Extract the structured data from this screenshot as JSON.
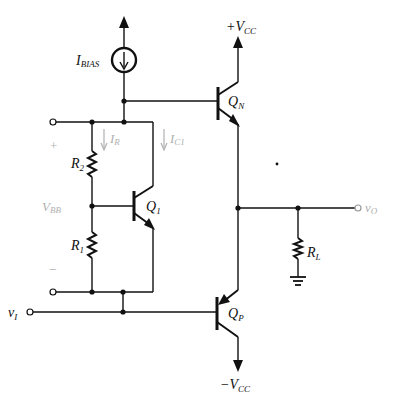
{
  "diagram": {
    "type": "circuit-schematic",
    "labels": {
      "vcc_pos": {
        "main": "+V",
        "sub": "CC"
      },
      "vcc_neg": {
        "main": "−V",
        "sub": "CC"
      },
      "ibias": {
        "main": "I",
        "sub": "BIAS"
      },
      "qn": {
        "main": "Q",
        "sub": "N"
      },
      "qp": {
        "main": "Q",
        "sub": "P"
      },
      "q1": {
        "main": "Q",
        "sub": "1"
      },
      "r1": {
        "main": "R",
        "sub": "1"
      },
      "r2": {
        "main": "R",
        "sub": "2"
      },
      "rl": {
        "main": "R",
        "sub": "L"
      },
      "ir": {
        "main": "I",
        "sub": "R"
      },
      "ic1": {
        "main": "I",
        "sub": "C1"
      },
      "vbb": {
        "main": "V",
        "sub": "BB"
      },
      "plus": "+",
      "minus": "−",
      "vi": {
        "main": "v",
        "sub": "I"
      },
      "vo": {
        "main": "v",
        "sub": "O"
      }
    },
    "components": [
      {
        "id": "IBIAS",
        "kind": "current-source"
      },
      {
        "id": "QN",
        "kind": "npn-transistor"
      },
      {
        "id": "QP",
        "kind": "pnp-transistor"
      },
      {
        "id": "Q1",
        "kind": "npn-transistor"
      },
      {
        "id": "R1",
        "kind": "resistor"
      },
      {
        "id": "R2",
        "kind": "resistor"
      },
      {
        "id": "RL",
        "kind": "resistor"
      },
      {
        "id": "GND",
        "kind": "ground"
      }
    ],
    "colors": {
      "wire": "#111111",
      "annotation": "#b0b0b0",
      "background": "#ffffff"
    }
  }
}
